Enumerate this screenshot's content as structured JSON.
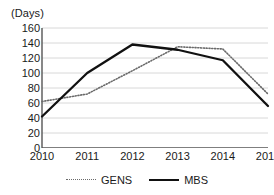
{
  "chart_data": {
    "type": "line",
    "title": "(Days)",
    "xlabel": "",
    "ylabel": "(Days)",
    "categories": [
      "2010",
      "2011",
      "2012",
      "2013",
      "2014",
      "2015"
    ],
    "ylim": [
      0,
      160
    ],
    "ytick_step": 20,
    "yticks": [
      "160",
      "140",
      "120",
      "100",
      "80",
      "60",
      "40",
      "20",
      "0"
    ],
    "grid": true,
    "grid_axis": "y",
    "legend_position": "bottom",
    "series": [
      {
        "name": "GENS",
        "style": "dotted",
        "color": "#6a6a6a",
        "values": [
          62,
          72,
          103,
          135,
          132,
          72
        ]
      },
      {
        "name": "MBS",
        "style": "solid",
        "color": "#111111",
        "values": [
          42,
          100,
          138,
          131,
          117,
          56
        ]
      }
    ]
  },
  "colors": {
    "background": "#ffffff",
    "axis": "#555555",
    "grid": "#d8d8d8",
    "text": "#1a1a1a"
  }
}
